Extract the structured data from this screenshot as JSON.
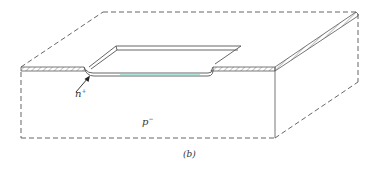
{
  "figure": {
    "caption": "(b)",
    "labels": {
      "n_region": {
        "base": "n",
        "superscript": "+"
      },
      "p_region": {
        "base": "p",
        "superscript": "−"
      }
    },
    "colors": {
      "line": "#555555",
      "hatch": "#8a8a8a",
      "background": "#ffffff",
      "well_tint": "#7fd6c8"
    }
  }
}
